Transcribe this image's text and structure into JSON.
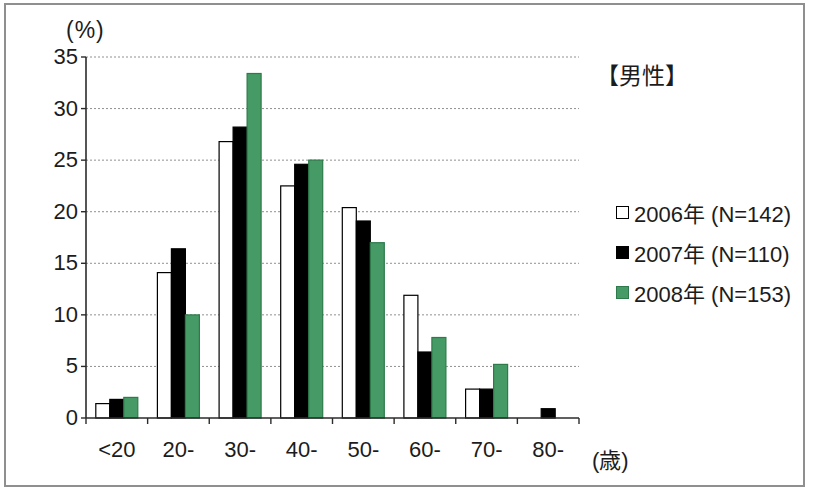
{
  "chart_data": {
    "type": "bar",
    "title": "【男性】",
    "ylabel": "(%)",
    "xunit": "(歳)",
    "ylim": [
      0,
      35
    ],
    "ytick_step": 5,
    "yticks": [
      0,
      5,
      10,
      15,
      20,
      25,
      30,
      35
    ],
    "grid": "horizontal-dashed",
    "legend_position": "right",
    "categories": [
      "<20",
      "20-",
      "30-",
      "40-",
      "50-",
      "60-",
      "70-",
      "80-"
    ],
    "series": [
      {
        "label": "2006年 (N=142)",
        "fill": "#ffffff",
        "border": "#000000",
        "values": [
          1.4,
          14.1,
          26.8,
          22.5,
          20.4,
          11.9,
          2.8,
          0
        ]
      },
      {
        "label": "2007年 (N=110)",
        "fill": "#000000",
        "border": "#000000",
        "values": [
          1.8,
          16.4,
          28.2,
          24.6,
          19.1,
          6.4,
          2.8,
          0.9
        ]
      },
      {
        "label": "2008年 (N=153)",
        "fill": "#459a65",
        "border": "#2e7a4b",
        "values": [
          2.0,
          10.0,
          33.4,
          25.0,
          17.0,
          7.8,
          5.2,
          0
        ]
      }
    ],
    "colors": {
      "grid": "#909090",
      "axis": "#2b2b2b",
      "frame": "#8f8f8f"
    }
  }
}
